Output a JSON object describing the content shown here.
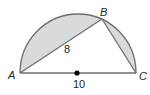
{
  "diagram": {
    "type": "semicircle-inscribed-triangle",
    "points": {
      "A": {
        "label": "A"
      },
      "B": {
        "label": "B"
      },
      "C": {
        "label": "C"
      }
    },
    "measures": {
      "AB": "8",
      "AC_diameter": "10"
    },
    "colors": {
      "shaded_region": "#d9dadb",
      "stroke": "#6d6e70",
      "text": "#231f20",
      "center_dot": "#000000"
    }
  }
}
